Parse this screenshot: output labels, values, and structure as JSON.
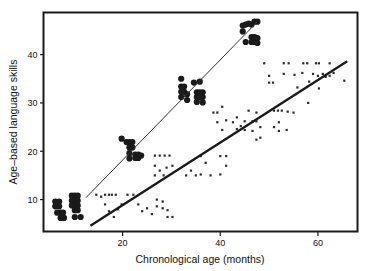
{
  "chart_data": {
    "type": "scatter",
    "title": "",
    "xlabel": "Chronological age (months)",
    "ylabel": "Age–based language skills",
    "xlim": [
      4,
      68
    ],
    "ylim": [
      3.5,
      48.5
    ],
    "xticks": [
      20,
      40,
      60
    ],
    "xtick_labels": [
      "20",
      "40",
      "60"
    ],
    "yticks": [
      10,
      20,
      30,
      40
    ],
    "ytick_labels": [
      "10",
      "20",
      "30",
      "40"
    ],
    "grid": false,
    "legend": null,
    "frame": "box",
    "series": [
      {
        "name": "typically-developing-group",
        "marker": "filled-circle-large",
        "color": "#1a1a1a",
        "size": 3.1,
        "points": [
          [
            6.2,
            9.6
          ],
          [
            6.2,
            8.6
          ],
          [
            6.6,
            7.3
          ],
          [
            7.0,
            9.6
          ],
          [
            7.0,
            8.6
          ],
          [
            7.3,
            7.3
          ],
          [
            7.3,
            6.2
          ],
          [
            7.8,
            7.3
          ],
          [
            8.0,
            6.2
          ],
          [
            9.6,
            10.8
          ],
          [
            9.6,
            9.8
          ],
          [
            9.6,
            8.8
          ],
          [
            10.2,
            10.8
          ],
          [
            10.2,
            9.8
          ],
          [
            10.2,
            8.8
          ],
          [
            10.2,
            7.8
          ],
          [
            10.2,
            6.4
          ],
          [
            10.8,
            10.8
          ],
          [
            10.8,
            9.8
          ],
          [
            10.8,
            8.8
          ],
          [
            10.8,
            7.8
          ],
          [
            11.4,
            6.4
          ],
          [
            19.8,
            22.6
          ],
          [
            20.8,
            21.9
          ],
          [
            21.4,
            21.9
          ],
          [
            21.4,
            20.8
          ],
          [
            21.4,
            19.6
          ],
          [
            21.4,
            18.5
          ],
          [
            22.0,
            21.9
          ],
          [
            22.0,
            20.8
          ],
          [
            22.6,
            19.3
          ],
          [
            22.6,
            18.6
          ],
          [
            23.2,
            19.3
          ],
          [
            23.2,
            18.6
          ],
          [
            23.8,
            19.1
          ],
          [
            32.0,
            35.0
          ],
          [
            32.0,
            33.4
          ],
          [
            32.0,
            32.3
          ],
          [
            32.0,
            31.2
          ],
          [
            32.6,
            33.4
          ],
          [
            32.6,
            32.3
          ],
          [
            33.2,
            31.8
          ],
          [
            33.2,
            30.6
          ],
          [
            34.6,
            34.2
          ],
          [
            35.2,
            32.2
          ],
          [
            35.2,
            31.2
          ],
          [
            35.2,
            30.2
          ],
          [
            35.8,
            34.4
          ],
          [
            35.8,
            32.2
          ],
          [
            35.8,
            31.2
          ],
          [
            36.4,
            32.2
          ],
          [
            36.4,
            31.2
          ],
          [
            36.4,
            30.1
          ],
          [
            44.6,
            46.0
          ],
          [
            44.6,
            44.8
          ],
          [
            45.2,
            46.2
          ],
          [
            45.2,
            42.6
          ],
          [
            45.8,
            46.4
          ],
          [
            46.4,
            46.2
          ],
          [
            46.4,
            43.6
          ],
          [
            46.4,
            42.6
          ],
          [
            47.0,
            46.8
          ],
          [
            47.0,
            43.6
          ],
          [
            47.0,
            42.6
          ],
          [
            47.6,
            46.8
          ],
          [
            47.6,
            43.4
          ],
          [
            47.6,
            42.4
          ]
        ]
      },
      {
        "name": "language-delayed-group",
        "marker": "dot-small",
        "color": "#2b2b2b",
        "size": 1.1,
        "points": [
          [
            14.6,
            11.0
          ],
          [
            15.6,
            10.6
          ],
          [
            16.4,
            11.0
          ],
          [
            17.2,
            11.0
          ],
          [
            17.8,
            11.0
          ],
          [
            18.6,
            11.0
          ],
          [
            16.4,
            9.0
          ],
          [
            17.2,
            7.6
          ],
          [
            18.2,
            6.4
          ],
          [
            19.0,
            8.0
          ],
          [
            19.8,
            9.0
          ],
          [
            21.0,
            11.0
          ],
          [
            22.2,
            11.0
          ],
          [
            23.2,
            9.0
          ],
          [
            24.0,
            7.6
          ],
          [
            25.0,
            8.2
          ],
          [
            26.0,
            7.0
          ],
          [
            26.6,
            19.1
          ],
          [
            27.6,
            19.1
          ],
          [
            28.6,
            19.1
          ],
          [
            29.6,
            19.1
          ],
          [
            26.6,
            17.0
          ],
          [
            27.6,
            16.0
          ],
          [
            26.6,
            15.0
          ],
          [
            28.4,
            15.0
          ],
          [
            29.0,
            16.6
          ],
          [
            30.2,
            17.0
          ],
          [
            27.0,
            10.0
          ],
          [
            27.0,
            8.6
          ],
          [
            28.2,
            9.6
          ],
          [
            28.2,
            8.2
          ],
          [
            29.2,
            7.8
          ],
          [
            29.2,
            6.4
          ],
          [
            30.2,
            6.4
          ],
          [
            33.0,
            15.0
          ],
          [
            34.0,
            16.0
          ],
          [
            35.0,
            15.0
          ],
          [
            36.0,
            15.2
          ],
          [
            36.0,
            19.0
          ],
          [
            37.0,
            17.6
          ],
          [
            38.0,
            15.0
          ],
          [
            38.6,
            28.0
          ],
          [
            39.4,
            26.0
          ],
          [
            39.4,
            28.0
          ],
          [
            40.4,
            24.4
          ],
          [
            40.4,
            29.2
          ],
          [
            41.2,
            26.4
          ],
          [
            41.2,
            19.0
          ],
          [
            41.2,
            17.0
          ],
          [
            40.0,
            19.0
          ],
          [
            40.0,
            15.2
          ],
          [
            42.6,
            26.0
          ],
          [
            43.4,
            24.6
          ],
          [
            43.4,
            27.0
          ],
          [
            44.2,
            25.2
          ],
          [
            45.0,
            26.2
          ],
          [
            45.0,
            24.4
          ],
          [
            45.8,
            28.4
          ],
          [
            46.6,
            26.2
          ],
          [
            46.6,
            24.2
          ],
          [
            47.4,
            28.0
          ],
          [
            47.4,
            26.2
          ],
          [
            47.4,
            22.4
          ],
          [
            48.2,
            25.0
          ],
          [
            48.2,
            22.8
          ],
          [
            49.0,
            38.2
          ],
          [
            50.0,
            34.2
          ],
          [
            50.0,
            35.6
          ],
          [
            50.8,
            34.2
          ],
          [
            51.0,
            28.4
          ],
          [
            51.8,
            28.4
          ],
          [
            52.0,
            26.0
          ],
          [
            52.6,
            28.4
          ],
          [
            51.0,
            25.0
          ],
          [
            52.0,
            24.2
          ],
          [
            53.8,
            28.2
          ],
          [
            53.6,
            24.4
          ],
          [
            53.0,
            36.0
          ],
          [
            53.0,
            38.2
          ],
          [
            54.0,
            38.2
          ],
          [
            55.2,
            35.8
          ],
          [
            55.0,
            28.0
          ],
          [
            55.8,
            33.2
          ],
          [
            56.8,
            36.2
          ],
          [
            57.0,
            38.2
          ],
          [
            57.8,
            38.2
          ],
          [
            58.2,
            34.4
          ],
          [
            58.0,
            30.0
          ],
          [
            59.0,
            36.0
          ],
          [
            59.6,
            38.2
          ],
          [
            60.2,
            38.2
          ],
          [
            60.0,
            35.6
          ],
          [
            60.2,
            33.0
          ],
          [
            61.0,
            36.0
          ],
          [
            61.6,
            35.4
          ],
          [
            62.4,
            38.2
          ],
          [
            62.4,
            35.6
          ],
          [
            63.2,
            36.2
          ],
          [
            65.4,
            34.6
          ]
        ]
      }
    ],
    "fit_lines": [
      {
        "name": "upper-regression-line",
        "color": "#333333",
        "width": 1.0,
        "x0": 12.5,
        "y0": 10.4,
        "x1": 47.6,
        "y1": 46.8
      },
      {
        "name": "lower-regression-line",
        "color": "#1a1a1a",
        "width": 2.4,
        "x0": 13.4,
        "y0": 4.6,
        "x1": 66.0,
        "y1": 38.6
      }
    ]
  },
  "axes": {
    "x_title": "Chronological age (months)",
    "y_title": "Age–based language skills"
  }
}
